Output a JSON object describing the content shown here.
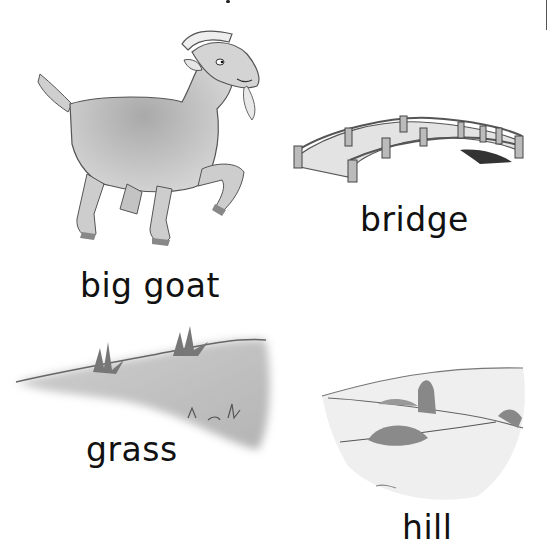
{
  "page": {
    "cards": [
      {
        "id": "goat",
        "label": "big goat",
        "icon": "goat-illustration"
      },
      {
        "id": "bridge",
        "label": "bridge",
        "icon": "bridge-illustration"
      },
      {
        "id": "grass",
        "label": "grass",
        "icon": "grass-illustration"
      },
      {
        "id": "hill",
        "label": "hill",
        "icon": "hill-illustration"
      }
    ],
    "colors": {
      "ink": "#111111",
      "shade": "#bdbdbd",
      "paper": "#ffffff"
    }
  }
}
